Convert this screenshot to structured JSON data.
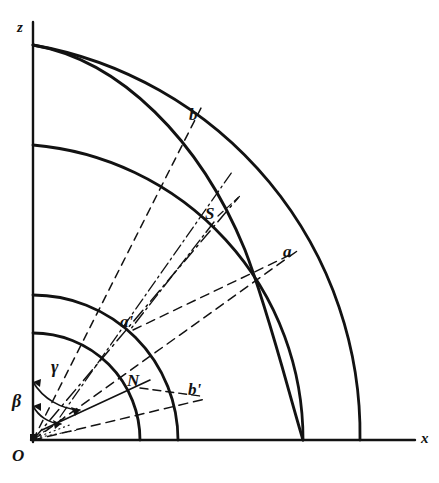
{
  "figure": {
    "kind": "geometric-construction-diagram",
    "background_color": "#ffffff",
    "ink_color": "#121212",
    "origin_px": [
      33,
      440
    ],
    "axes": {
      "z_label": "z",
      "x_label": "x",
      "z_axis": {
        "x": 33,
        "y_top": 22,
        "y_bottom": 440
      },
      "x_axis": {
        "y": 440,
        "x_left": 33,
        "x_right": 415
      }
    },
    "labels": {
      "origin": "O",
      "point_b": "b",
      "point_S": "S",
      "point_a": "a",
      "point_a_prime": "a'",
      "point_b_prime": "b'",
      "point_N": "N",
      "angle_beta": "β",
      "angle_gamma": "γ"
    },
    "arcs": [
      {
        "name": "outer-arc-1",
        "radius": 395,
        "z_intercept_y": 45,
        "x_intercept_x": 360,
        "style": "solid",
        "width": 2.6
      },
      {
        "name": "arc-2",
        "radius": 295,
        "z_intercept_y": 145,
        "x_intercept_x": 303,
        "style": "solid",
        "width": 2.6
      },
      {
        "name": "arc-3",
        "radius": 145,
        "z_intercept_y": 295,
        "x_intercept_x": 218,
        "style": "solid",
        "width": 2.6
      },
      {
        "name": "inner-arc-4",
        "radius": 107,
        "z_intercept_y": 333,
        "x_intercept_x": 165,
        "style": "solid",
        "width": 2.6
      }
    ],
    "rays": [
      {
        "name": "ray-to-b",
        "angle_from_z_deg": 36,
        "style": "dashed",
        "endpoint": "b"
      },
      {
        "name": "ray-to-S",
        "angle_from_z_deg": 52,
        "style": "dashdot",
        "endpoint": "S"
      },
      {
        "name": "ray-to-a",
        "angle_from_z_deg": 63,
        "style": "dashed",
        "endpoint": "a"
      },
      {
        "name": "ray-to-b-prime",
        "angle_from_z_deg": 76,
        "style": "dashed",
        "endpoint": "b'"
      },
      {
        "name": "ray-to-N",
        "angle_from_z_deg": 57,
        "style": "solid",
        "endpoint": "N"
      }
    ],
    "angle_marks": [
      {
        "name": "angle-gamma",
        "label": "γ",
        "from_deg": 0,
        "to_deg": 36,
        "radius_px": 58
      },
      {
        "name": "angle-beta",
        "label": "β",
        "from_deg": 0,
        "to_deg": 52,
        "radius_px": 34
      }
    ],
    "points": [
      {
        "name": "b",
        "x": 196,
        "y": 118
      },
      {
        "name": "S",
        "x": 216,
        "y": 218
      },
      {
        "name": "a",
        "x": 289,
        "y": 254
      },
      {
        "name": "a'",
        "x": 128,
        "y": 325
      },
      {
        "name": "N",
        "x": 136,
        "y": 384
      },
      {
        "name": "b'",
        "x": 195,
        "y": 392
      }
    ]
  }
}
